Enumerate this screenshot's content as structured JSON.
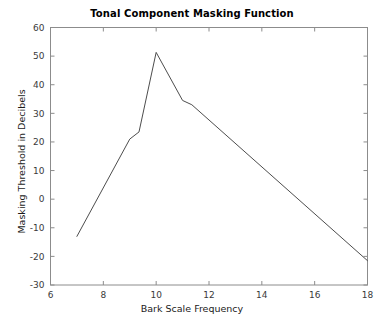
{
  "figure": {
    "background_color": "#ffffff",
    "line_color": "#4d4d4d",
    "axis_color": "#8c8c8c",
    "text_color": "#1a1a1a"
  },
  "chart_data": {
    "type": "line",
    "title": "Tonal Component Masking Function",
    "xlabel": "Bark Scale Frequency",
    "ylabel": "Masking Threshold in Decibels",
    "xlim": [
      6,
      18
    ],
    "ylim": [
      -30,
      60
    ],
    "xticks": [
      6,
      8,
      10,
      12,
      14,
      16,
      18
    ],
    "xtick_labels": [
      "6",
      "8",
      "10",
      "12",
      "14",
      "16",
      "18"
    ],
    "yticks": [
      -30,
      -20,
      -10,
      0,
      10,
      20,
      30,
      40,
      50,
      60
    ],
    "ytick_labels": [
      "-30",
      "-20",
      "-10",
      "0",
      "10",
      "20",
      "30",
      "40",
      "50",
      "60"
    ],
    "grid": false,
    "legend": null,
    "series": [
      {
        "name": "Masking threshold",
        "color": "#4d4d4d",
        "x": [
          7.0,
          9.0,
          9.35,
          10.0,
          11.0,
          11.35,
          18.0
        ],
        "y": [
          -13.0,
          21.0,
          23.5,
          51.3,
          34.5,
          33.0,
          -21.5
        ]
      }
    ]
  }
}
